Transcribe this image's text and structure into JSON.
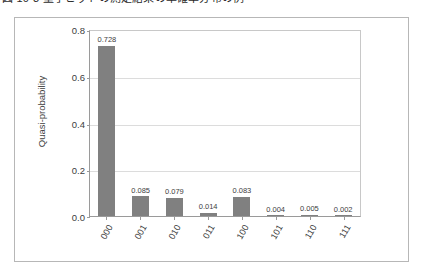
{
  "caption": {
    "text": "図 10-3  量子ビットの測定結果の準確率分布の例"
  },
  "chart_data": {
    "type": "bar",
    "title": "",
    "subtitle": "",
    "xlabel": "",
    "ylabel": "Quasi-probability",
    "categories": [
      "000",
      "001",
      "010",
      "011",
      "100",
      "101",
      "110",
      "111"
    ],
    "values": [
      0.728,
      0.085,
      0.079,
      0.014,
      0.083,
      0.004,
      0.005,
      0.002
    ],
    "value_labels": [
      "0.728",
      "0.085",
      "0.079",
      "0.014",
      "0.083",
      "0.004",
      "0.005",
      "0.002"
    ],
    "ylim": [
      0.0,
      0.8
    ],
    "ytick_labels": [
      "0.0",
      "0.2",
      "0.4",
      "0.6",
      "0.8"
    ],
    "ytick_values": [
      0.0,
      0.2,
      0.4,
      0.6,
      0.8
    ],
    "grid": "horizontal",
    "legend": "none",
    "bar_color": "#808080",
    "grid_color": "#dcdcdc",
    "axis_color": "#9a9a9a",
    "frame_color": "#b7b7b7",
    "text_color": "#3d3d3d",
    "background": "#ffffff"
  }
}
